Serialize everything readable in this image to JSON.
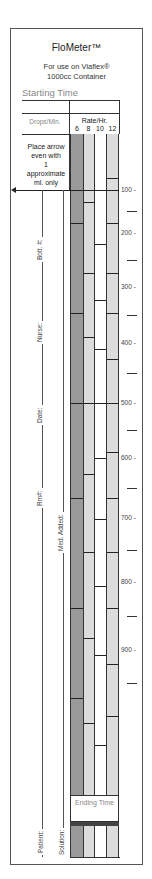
{
  "header": {
    "title": "FloMeter™",
    "subtitle_line1": "For use on Viaflex®",
    "subtitle_line2": "1000cc Container",
    "starting_time_label": "Starting Time"
  },
  "table_header": {
    "drops_min_label": "Drops/Min.",
    "rate_label": "Rate/Hr.",
    "rate_columns": [
      "6",
      "8",
      "10",
      "12"
    ]
  },
  "instructions": {
    "line1": "Place arrow",
    "line2": "even with",
    "line3": "1",
    "line4": "approximate",
    "line5": "ml. only"
  },
  "left_labels": {
    "bottle": "Bott. #:",
    "nurse": "Nurse:",
    "date": "Date:",
    "rm": "Rm#:",
    "med_added": "Med. Added:",
    "patient": "Patient:",
    "solution": "Solution:"
  },
  "scale": {
    "labels": [
      "100",
      "200",
      "300",
      "400",
      "500",
      "600",
      "700",
      "800",
      "900"
    ],
    "label_y": [
      190,
      233,
      287,
      343,
      403,
      458,
      518,
      582,
      650
    ],
    "mid_tick_y": [
      211,
      260,
      315,
      373,
      430,
      488,
      550,
      616,
      683
    ]
  },
  "columns": {
    "colors": {
      "6": "#9a9a9a",
      "8": "#dcdcdc",
      "10": "#ffffff",
      "12": "#dcdcdc"
    },
    "divisions": {
      "6": [
        190,
        223,
        313,
        403,
        498,
        608,
        698
      ],
      "8": [
        190,
        202,
        273,
        337,
        403,
        474,
        552,
        638,
        723
      ],
      "10": [
        190,
        244,
        300,
        349,
        403,
        458,
        519,
        586,
        655,
        745
      ],
      "12": [
        178,
        190,
        223,
        273,
        313,
        359,
        403,
        452,
        498,
        552,
        608,
        664,
        716
      ]
    }
  },
  "footer": {
    "ending_time_label": "Ending Time"
  }
}
